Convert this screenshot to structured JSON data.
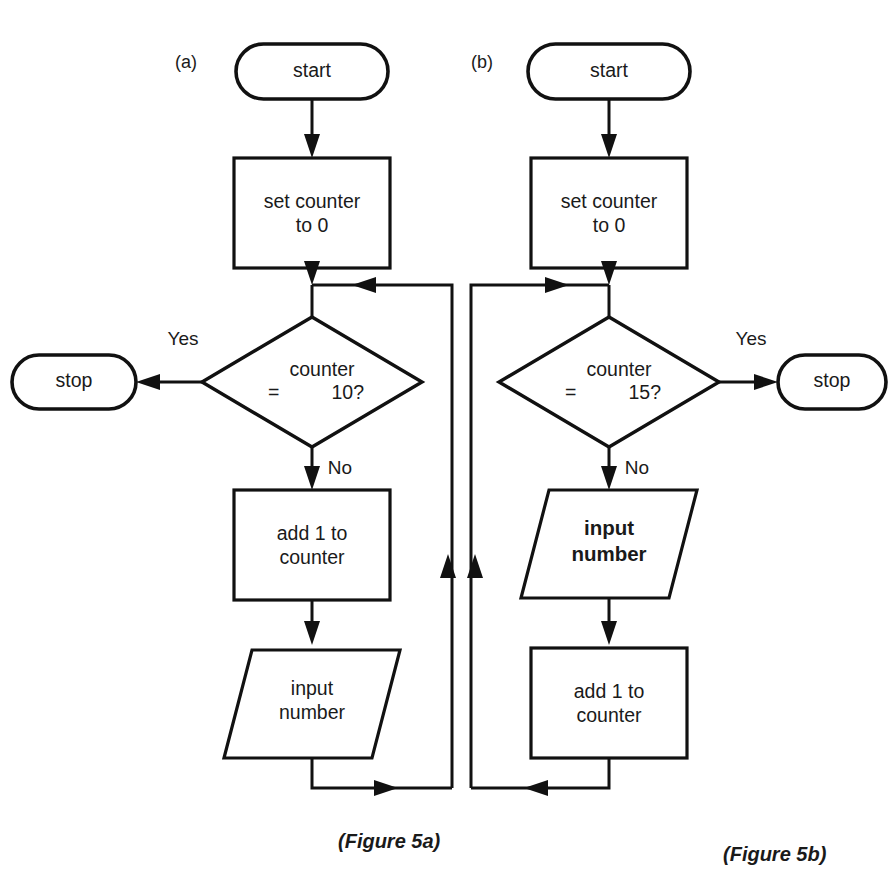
{
  "figure": {
    "background_color": "#ffffff",
    "line_color": "#111111",
    "text_color": "#1a1a1a",
    "panel_a_tag": "(a)",
    "panel_b_tag": "(b)",
    "caption_a": "(Figure 5a)",
    "caption_b": "(Figure 5b)"
  },
  "panel_a": {
    "tag": "(a)",
    "caption": "(Figure 5a)",
    "start": "start",
    "set_counter_line1": "set counter",
    "set_counter_line2": "to 0",
    "decision_line1": "counter",
    "decision_eq": "=",
    "decision_value": "10?",
    "yes_label": "Yes",
    "no_label": "No",
    "stop": "stop",
    "add_line1": "add 1 to",
    "add_line2": "counter",
    "input_line1": "input",
    "input_line2": "number",
    "yes_side": "left",
    "loop_side": "right"
  },
  "panel_b": {
    "tag": "(b)",
    "caption": "(Figure 5b)",
    "start": "start",
    "set_counter_line1": "set counter",
    "set_counter_line2": "to 0",
    "decision_line1": "counter",
    "decision_eq": "=",
    "decision_value": "15?",
    "yes_label": "Yes",
    "no_label": "No",
    "stop": "stop",
    "input_line1": "input",
    "input_line2": "number",
    "add_line1": "add 1 to",
    "add_line2": "counter",
    "yes_side": "right",
    "loop_side": "left"
  }
}
